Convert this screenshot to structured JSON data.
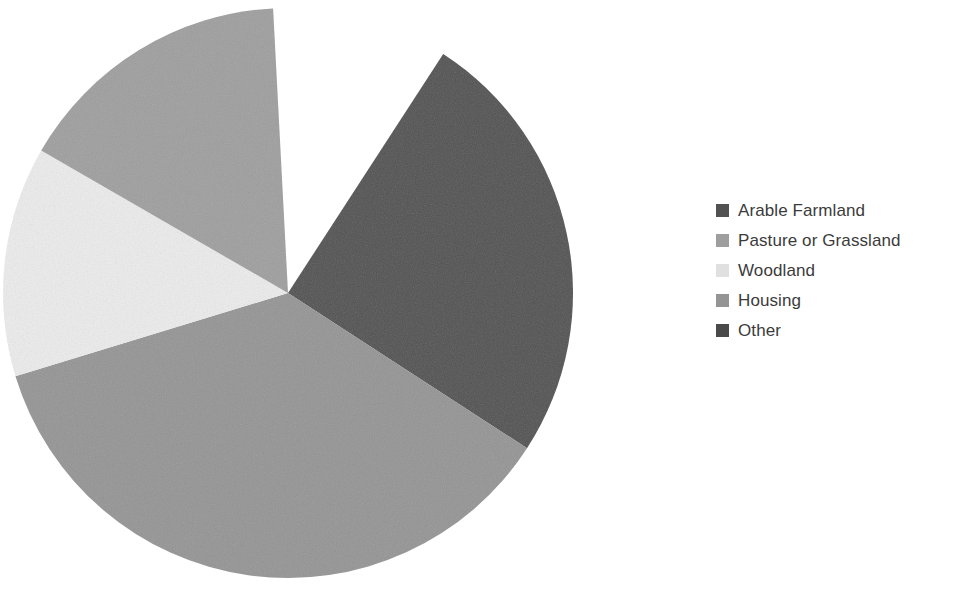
{
  "chart_data": {
    "type": "pie",
    "title": "",
    "subtitle": "",
    "xlabel": "",
    "ylabel": "",
    "grid": false,
    "legend_position": "right",
    "start_angle_deg": -57,
    "direction": "clockwise",
    "categories": [
      "Arable Farmland",
      "Pasture or Grassland",
      "Woodland",
      "Housing",
      "Other"
    ],
    "values": [
      25,
      16,
      13,
      36,
      0
    ],
    "value_unit": "percent",
    "colors": [
      "#525252",
      "#9e9e9e",
      "#ececec",
      "#949494",
      "#4a4a4a"
    ],
    "slices": [
      {
        "label": "Arable Farmland",
        "value": 25,
        "angle_deg": 90,
        "color": "#525252",
        "start_deg": -57,
        "end_deg": 33
      },
      {
        "label": "Housing",
        "value": 36,
        "angle_deg": 130,
        "color": "#949494",
        "start_deg": 33,
        "end_deg": 163
      },
      {
        "label": "Woodland",
        "value": 13,
        "angle_deg": 47,
        "color": "#ececec",
        "start_deg": 163,
        "end_deg": 210
      },
      {
        "label": "Pasture or Grassland",
        "value": 16,
        "angle_deg": 57,
        "color": "#9e9e9e",
        "start_deg": 210,
        "end_deg": 267
      },
      {
        "label": "Other",
        "value": 0,
        "angle_deg": 0,
        "color": "#4a4a4a",
        "start_deg": 267,
        "end_deg": 267
      }
    ],
    "geometry": {
      "center_x": 288,
      "center_y": 293,
      "radius": 285
    }
  },
  "legend": {
    "items": [
      {
        "label": "Arable Farmland",
        "color": "#525252"
      },
      {
        "label": "Pasture or Grassland",
        "color": "#9e9e9e"
      },
      {
        "label": "Woodland",
        "color": "#e0e0e0"
      },
      {
        "label": "Housing",
        "color": "#949494"
      },
      {
        "label": "Other",
        "color": "#4a4a4a"
      }
    ]
  }
}
